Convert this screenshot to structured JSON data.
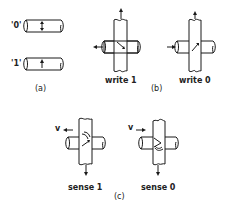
{
  "figure": {
    "panel_a": {
      "caption": "(a)",
      "states": [
        {
          "label": "'0'",
          "magnetization": "down-up (both)"
        },
        {
          "label": "'1'",
          "magnetization": "up"
        }
      ]
    },
    "panel_b": {
      "caption": "(b)",
      "items": [
        {
          "label": "write 1",
          "current_arrow": "left",
          "vertical_arrow": "up",
          "field_direction": "diagonal-down-right"
        },
        {
          "label": "write 0",
          "current_arrow": "right",
          "vertical_arrow": "up",
          "field_direction": "diagonal-down-left"
        }
      ]
    },
    "panel_c": {
      "caption": "(c)",
      "items": [
        {
          "label": "sense 1",
          "voltage_label": "v",
          "voltage_arrow": "left",
          "vertical_arrow": "down"
        },
        {
          "label": "sense 0",
          "voltage_label": "v",
          "voltage_arrow": "right",
          "vertical_arrow": "down"
        }
      ]
    }
  }
}
